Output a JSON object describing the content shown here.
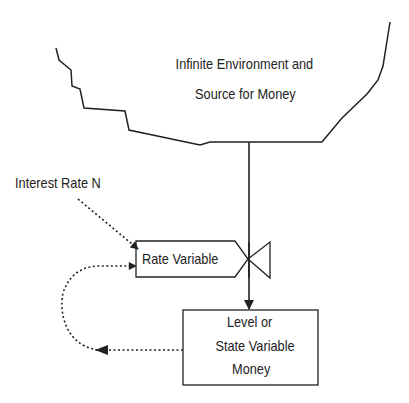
{
  "diagram": {
    "type": "system-dynamics-stock-flow",
    "source": {
      "label_line1": "Infinite Environment and",
      "label_line2": "Source for Money"
    },
    "input": {
      "label": "Interest Rate N"
    },
    "rate": {
      "label": "Rate Variable"
    },
    "level": {
      "label_line1": "Level or",
      "label_line2": "State Variable",
      "label_line3": "Money"
    },
    "connections": [
      {
        "from": "Infinite Environment and Source for Money",
        "to": "Level or State Variable Money",
        "style": "solid",
        "via": "Rate Variable valve"
      },
      {
        "from": "Interest Rate N",
        "to": "Rate Variable",
        "style": "dotted"
      },
      {
        "from": "Level or State Variable Money",
        "to": "Rate Variable",
        "style": "dotted",
        "shape": "curved feedback loop"
      }
    ],
    "colors": {
      "line": "#222222",
      "background": "#ffffff"
    }
  }
}
